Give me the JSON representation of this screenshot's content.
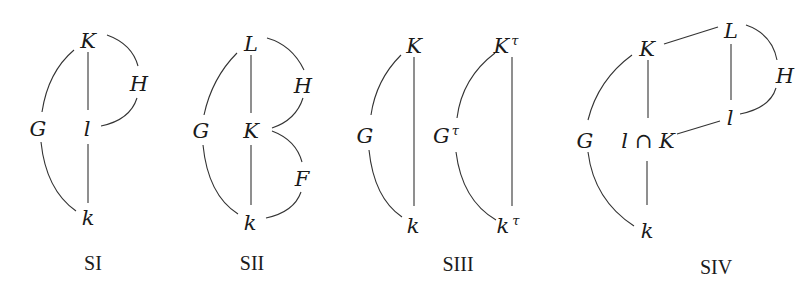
{
  "diagrams": [
    {
      "caption": "SI",
      "nodes": {
        "K": "K",
        "H": "H",
        "G": "G",
        "l": "l",
        "k": "k"
      },
      "edges": [
        [
          "K",
          "l"
        ],
        [
          "l",
          "k"
        ],
        [
          "K",
          "G"
        ],
        [
          "G",
          "k"
        ],
        [
          "K",
          "H"
        ],
        [
          "H",
          "l"
        ]
      ]
    },
    {
      "caption": "SII",
      "nodes": {
        "L": "L",
        "H": "H",
        "G": "G",
        "K": "K",
        "F": "F",
        "k": "k"
      },
      "edges": [
        [
          "L",
          "K"
        ],
        [
          "K",
          "k"
        ],
        [
          "L",
          "G"
        ],
        [
          "G",
          "k"
        ],
        [
          "L",
          "H"
        ],
        [
          "H",
          "K"
        ],
        [
          "K",
          "F"
        ],
        [
          "F",
          "k"
        ]
      ]
    },
    {
      "caption": "SIII",
      "nodes": {
        "K": "K",
        "G": "G",
        "k": "k",
        "Kt": "K",
        "Kt_sup": "τ",
        "Gt": "G",
        "Gt_sup": "τ",
        "kt": "k",
        "kt_sup": "τ"
      },
      "edges": [
        [
          "K",
          "k"
        ],
        [
          "K",
          "G"
        ],
        [
          "G",
          "k"
        ],
        [
          "Kτ",
          "kτ"
        ],
        [
          "Kτ",
          "Gτ"
        ],
        [
          "Gτ",
          "kτ"
        ]
      ]
    },
    {
      "caption": "SIV",
      "nodes": {
        "L": "L",
        "K": "K",
        "H": "H",
        "l": "l",
        "G": "G",
        "lK": "l ∩ K",
        "k": "k"
      },
      "edges": [
        [
          "L",
          "K"
        ],
        [
          "L",
          "l"
        ],
        [
          "L",
          "H"
        ],
        [
          "H",
          "l"
        ],
        [
          "l",
          "l∩K"
        ],
        [
          "K",
          "l∩K"
        ],
        [
          "l∩K",
          "k"
        ],
        [
          "K",
          "G"
        ],
        [
          "G",
          "k"
        ]
      ]
    }
  ]
}
